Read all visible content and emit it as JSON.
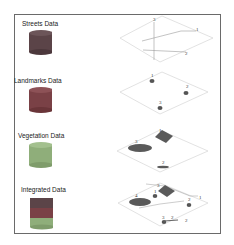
{
  "layers": [
    {
      "label": "Streets Data",
      "color": "#5b4448"
    },
    {
      "label": "Landmarks Data",
      "color": "#7a4146"
    },
    {
      "label": "Vegetation Data",
      "color": "#8fae7a"
    },
    {
      "label": "Integrated Data",
      "colors": [
        "#5b4448",
        "#7a4146",
        "#8fae7a"
      ]
    }
  ],
  "maps": {
    "streets": {
      "labels": [
        "3",
        "1",
        "2"
      ]
    },
    "landmarks": {
      "labels": [
        "1",
        "2",
        "3"
      ]
    },
    "vegetation": {
      "labels": [
        "1",
        "3",
        "2"
      ]
    },
    "integrated": {
      "labels": [
        "3",
        "1",
        "4",
        "2",
        "1",
        "3",
        "2",
        "2"
      ]
    }
  },
  "colors": {
    "frame": "#6a6a6a",
    "map_outline": "#cfcfcf",
    "feature_fill": "#555555"
  }
}
